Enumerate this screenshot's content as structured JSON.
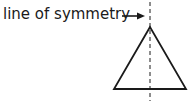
{
  "diagram": {
    "label": "line of symmetry",
    "colors": {
      "stroke": "#1a1a1a",
      "background": "#ffffff"
    },
    "shape": "isosceles-triangle",
    "triangle": {
      "apex": [
        150,
        27
      ],
      "base_left": [
        114,
        89
      ],
      "base_right": [
        186,
        89
      ]
    },
    "symmetry_line": {
      "x": 150,
      "y1": 2,
      "y2": 101,
      "style": "dashed"
    },
    "arrow": {
      "x1": 122,
      "x2": 145,
      "y": 16
    }
  }
}
